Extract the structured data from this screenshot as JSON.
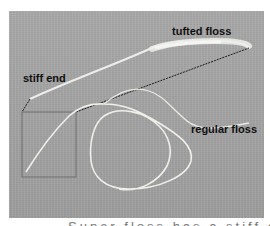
{
  "figure": {
    "labels": {
      "tufted": "tufted floss",
      "stiff": "stiff end",
      "regular": "regular floss"
    },
    "caption_partial": "Super floss has a stiff end",
    "colors": {
      "background": "#a6a6a6",
      "floss": "#f2f2ee",
      "label_text": "#111111",
      "inset_border": "#6e6e6e",
      "dotted_line": "#1a1a1a"
    }
  }
}
